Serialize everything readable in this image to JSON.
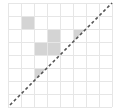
{
  "diagram": {
    "grid": {
      "cols": 8,
      "rows": 8,
      "origin_x": 8,
      "origin_y": 3,
      "cell_size": 13,
      "line_color": "#e6e6e6",
      "line_width": 1
    },
    "shaded_cells": [
      {
        "col": 1,
        "row": 1,
        "shape": "square"
      },
      {
        "col": 3,
        "row": 2,
        "shape": "square"
      },
      {
        "col": 2,
        "row": 3,
        "shape": "square"
      },
      {
        "col": 3,
        "row": 3,
        "shape": "square"
      },
      {
        "col": 5,
        "row": 2,
        "shape": "triangle-upper-left"
      },
      {
        "col": 2,
        "row": 5,
        "shape": "triangle-upper-left"
      }
    ],
    "shade_color": "#d4d4d4",
    "diagonal": {
      "style": "dashed",
      "color": "#555555",
      "width": 1.6,
      "dash": "3,2.5",
      "from": "bottom-left",
      "to": "top-right"
    }
  }
}
